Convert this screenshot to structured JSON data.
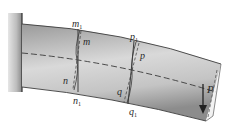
{
  "diagram": {
    "type": "cantilever-beam-bending",
    "colors": {
      "background": "#ffffff",
      "wall_light": "#d8d8d8",
      "wall_dark": "#9a9a9a",
      "wall_edge": "#3a3a3a",
      "beam_light": "#d4d4d4",
      "beam_dark": "#8e8e8e",
      "beam_edge": "#4a4a4a",
      "lines": "#2a2a2a"
    },
    "labels": {
      "m1": {
        "main": "m",
        "sub": "1"
      },
      "m": {
        "main": "m"
      },
      "n": {
        "main": "n"
      },
      "n1": {
        "main": "n",
        "sub": "1"
      },
      "p1": {
        "main": "p",
        "sub": "1"
      },
      "p": {
        "main": "p"
      },
      "q": {
        "main": "q"
      },
      "q1": {
        "main": "q",
        "sub": "1"
      },
      "load": {
        "main": "P"
      }
    },
    "elements": [
      "fixed-support-wall",
      "cantilever-beam",
      "neutral-axis-dashed",
      "section-m1-n1",
      "section-m-n-deformed",
      "section-p1-q1",
      "section-p-q-deformed",
      "free-end-section",
      "load-arrow-P"
    ]
  }
}
